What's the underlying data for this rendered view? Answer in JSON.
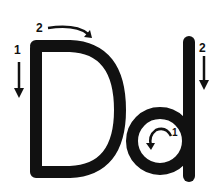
{
  "worksheet": {
    "uppercase_letter": "D",
    "lowercase_letter": "d",
    "stroke_color": "#111111",
    "background": "#ffffff",
    "uppercase_steps": [
      {
        "number": "1",
        "direction": "down",
        "icon": "arrow-down-icon"
      },
      {
        "number": "2",
        "direction": "curve-right",
        "icon": "curved-arrow-right-icon"
      }
    ],
    "lowercase_steps": [
      {
        "number": "1",
        "direction": "counter-clockwise-circle",
        "icon": "counter-clockwise-arrow-icon"
      },
      {
        "number": "2",
        "direction": "down",
        "icon": "arrow-down-icon"
      }
    ]
  }
}
